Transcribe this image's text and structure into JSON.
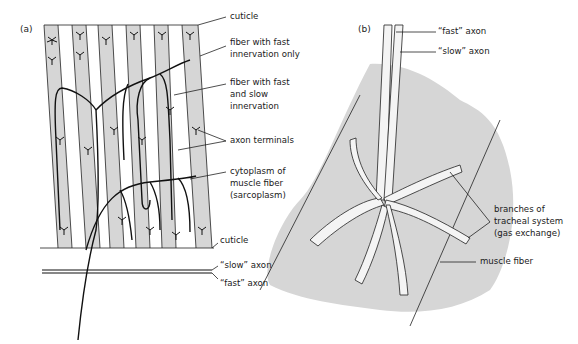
{
  "figure": {
    "panel_a": {
      "label": "(a)",
      "annotations": {
        "cuticle_top": "cuticle",
        "fast_only_1": "fiber with fast",
        "fast_only_2": "innervation only",
        "fast_slow_1": "fiber with fast",
        "fast_slow_2": "and slow",
        "fast_slow_3": "innervation",
        "axon_terminals": "axon terminals",
        "cytoplasm_1": "cytoplasm of",
        "cytoplasm_2": "muscle fiber",
        "cytoplasm_3": "(sarcoplasm)",
        "cuticle_bottom": "cuticle",
        "slow_axon": "“slow” axon",
        "fast_axon": "“fast” axon"
      }
    },
    "panel_b": {
      "label": "(b)",
      "annotations": {
        "fast_axon": "“fast” axon",
        "slow_axon": "“slow” axon",
        "tracheal_1": "branches of",
        "tracheal_2": "tracheal system",
        "tracheal_3": "(gas exchange)",
        "muscle_fiber": "muscle fiber"
      }
    },
    "colors": {
      "fiber_shade": "#d4d4d4",
      "ink": "#1a1a1a",
      "background": "#ffffff"
    }
  }
}
